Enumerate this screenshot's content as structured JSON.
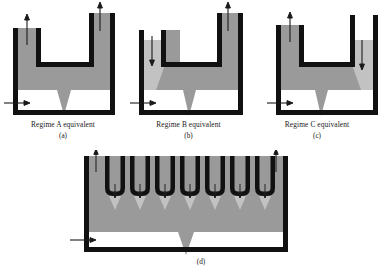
{
  "figure": {
    "panels": [
      {
        "id": "a",
        "caption": "Regime A equivalent",
        "letter": "(a)",
        "regime": "A",
        "description": "Two outer riser channels both with upward flow arrows, uniform dark grey fill, single central downward spike, horizontal inlet arrow at lower left.",
        "arrows": [
          {
            "name": "left-channel-arrow",
            "direction": "up"
          },
          {
            "name": "right-channel-arrow",
            "direction": "up"
          },
          {
            "name": "inlet-arrow",
            "direction": "right"
          }
        ],
        "spikes": 1,
        "fill": "uniform-dark"
      },
      {
        "id": "b",
        "caption": "Regime B equivalent",
        "letter": "(b)",
        "regime": "B",
        "description": "Left channel downward flow with light grey region, right channel upward flow with dark grey, diagonal interface, central downward spike, horizontal inlet arrow at lower left.",
        "arrows": [
          {
            "name": "left-channel-arrow",
            "direction": "down"
          },
          {
            "name": "right-channel-arrow",
            "direction": "up"
          },
          {
            "name": "inlet-arrow",
            "direction": "right"
          }
        ],
        "spikes": 1,
        "fill": "light-left-dark-right"
      },
      {
        "id": "c",
        "caption": "Regime C equivalent",
        "letter": "(c)",
        "regime": "C",
        "description": "Left channel upward flow with dark grey, right channel downward flow with light grey region, diagonal interface, central downward spike, horizontal inlet arrow at lower left.",
        "arrows": [
          {
            "name": "left-channel-arrow",
            "direction": "up"
          },
          {
            "name": "right-channel-arrow",
            "direction": "down"
          },
          {
            "name": "inlet-arrow",
            "direction": "right"
          }
        ],
        "spikes": 1,
        "fill": "dark-left-light-right"
      },
      {
        "id": "d",
        "caption": "",
        "letter": "(d)",
        "regime": "multi-channel",
        "description": "Wide vessel with two outer riser channels carrying upward arrows and seven inner U-shaped downcomer channels each with a downward arrow and a small downward spike; one large central downward spike; horizontal inlet arrow at lower left.",
        "inner_channel_count": 7,
        "arrows": [
          {
            "name": "left-outer-channel-arrow",
            "direction": "up"
          },
          {
            "name": "right-outer-channel-arrow",
            "direction": "up"
          },
          {
            "name": "inner-channel-arrow",
            "direction": "down"
          },
          {
            "name": "inlet-arrow",
            "direction": "right"
          }
        ],
        "spikes": 8,
        "fill": "uniform-dark"
      }
    ],
    "colors": {
      "wall": "#111111",
      "fill_dark": "#9a9a9a",
      "fill_light": "#c2c2c2",
      "background": "#ffffff",
      "arrow": "#1a1a1a",
      "text": "#1a1a1a"
    }
  }
}
